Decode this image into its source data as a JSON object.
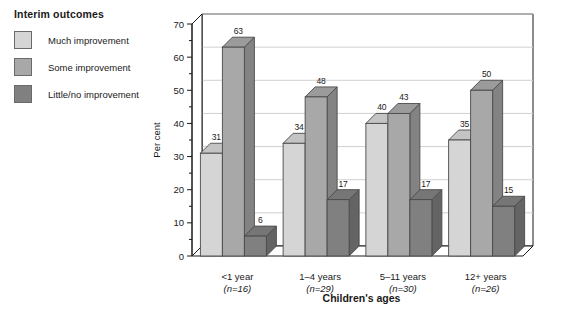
{
  "legend": {
    "title": "Interim outcomes",
    "items": [
      {
        "label": "Much improvement",
        "color": "#d5d5d5"
      },
      {
        "label": "Some improvement",
        "color": "#a8a8a8"
      },
      {
        "label": "Little/no improvement",
        "color": "#808080"
      }
    ]
  },
  "chart_data": {
    "type": "bar",
    "title": "Interim outcomes",
    "xlabel": "Children's ages",
    "ylabel": "Per cent",
    "ylim": [
      0,
      70
    ],
    "ytick_step": 10,
    "yminor_step": 5,
    "grid": true,
    "legend_position": "left-outside",
    "threed": true,
    "categories": [
      "<1 year",
      "1–4 years",
      "5–11 years",
      "12+ years"
    ],
    "category_sublabels": [
      "(n=16)",
      "(n=29)",
      "(n=30)",
      "(n=26)"
    ],
    "ytick_labels": [
      "0",
      "10",
      "20",
      "30",
      "40",
      "50",
      "60",
      "70"
    ],
    "series": [
      {
        "name": "Much improvement",
        "color": "#d5d5d5",
        "values": [
          31,
          34,
          40,
          35
        ]
      },
      {
        "name": "Some improvement",
        "color": "#a8a8a8",
        "values": [
          63,
          48,
          43,
          50
        ]
      },
      {
        "name": "Little/no improvement",
        "color": "#808080",
        "values": [
          6,
          17,
          17,
          15
        ]
      }
    ]
  },
  "colors": {
    "axis": "#1a1a1a",
    "grid": "#d0d0d0",
    "bar_outline": "#4a4a4a",
    "floor": "#ffffff",
    "background": "#ffffff"
  }
}
